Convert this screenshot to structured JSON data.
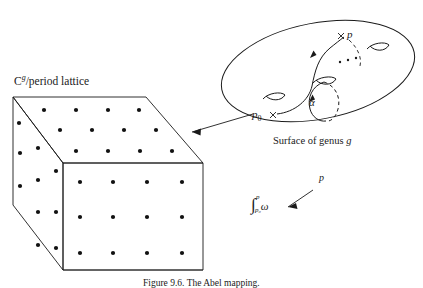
{
  "figure": {
    "caption": "Figure 9.6. The Abel mapping.",
    "lattice_label_main": "C",
    "lattice_label_sup": "g",
    "lattice_label_rest": "/period lattice",
    "genus_caption_prefix": "Surface of genus ",
    "genus_caption_var": "g",
    "point_p": "p",
    "point_p0_base": "p",
    "point_p0_sub": "0",
    "cross_marker": "×",
    "loop_label": "α",
    "abel_target_label": "p",
    "integral_sign": "∫",
    "integral_upper": "p",
    "integral_lower": "p₀",
    "integral_form": "ω",
    "handle_dots": "· · ·"
  },
  "colors": {
    "ink": "#1a1a1a",
    "background": "#ffffff",
    "dot": "#111111"
  },
  "lattice_box": {
    "front_face_dots_rows": 3,
    "front_face_dots_cols": 4,
    "top_face_dots_rows": 3,
    "top_face_dots_cols": 4,
    "left_face_dots_rows": 4,
    "left_face_dots_cols": 2
  },
  "surface": {
    "handle_count": 3,
    "handles_visible": [
      "left-handle",
      "middle-handle",
      "right-handle"
    ]
  }
}
